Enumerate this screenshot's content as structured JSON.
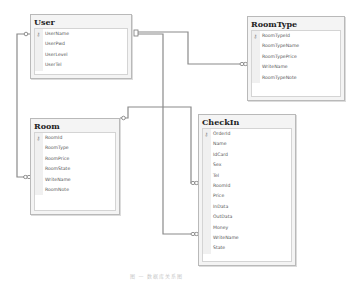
{
  "diagram": {
    "tables": [
      {
        "id": "user",
        "title": "User",
        "columns": [
          {
            "name": "UserName",
            "key": true
          },
          {
            "name": "UserPwd"
          },
          {
            "name": "UserLevel"
          },
          {
            "name": "UserTel"
          }
        ]
      },
      {
        "id": "roomtype",
        "title": "RoomType",
        "columns": [
          {
            "name": "RoomTypeId",
            "key": true
          },
          {
            "name": "RoomTypeName"
          },
          {
            "name": "RoomTypePrice"
          },
          {
            "name": "WriteName"
          },
          {
            "name": "RoomTypeNote"
          }
        ]
      },
      {
        "id": "room",
        "title": "Room",
        "columns": [
          {
            "name": "RoomId",
            "key": true
          },
          {
            "name": "RoomType"
          },
          {
            "name": "RoomPrice"
          },
          {
            "name": "RoomState"
          },
          {
            "name": "WriteName"
          },
          {
            "name": "RoomNote"
          }
        ]
      },
      {
        "id": "checkin",
        "title": "CheckIn",
        "columns": [
          {
            "name": "OrderId",
            "key": true
          },
          {
            "name": "Name"
          },
          {
            "name": "IdCard"
          },
          {
            "name": "Sex"
          },
          {
            "name": "Tel"
          },
          {
            "name": "RoomId"
          },
          {
            "name": "Price"
          },
          {
            "name": "InData"
          },
          {
            "name": "OutData"
          },
          {
            "name": "Money"
          },
          {
            "name": "WriteName"
          },
          {
            "name": "State"
          }
        ]
      }
    ],
    "relationships": [
      {
        "from": "User.UserName",
        "to": "Room.WriteName",
        "one": "key",
        "many": "infinity"
      },
      {
        "from": "User.UserName",
        "to": "RoomType.WriteName",
        "one": "key",
        "many": "infinity"
      },
      {
        "from": "User.UserName",
        "to": "CheckIn.WriteName",
        "one": "key",
        "many": "infinity"
      },
      {
        "from": "Room.RoomId",
        "to": "CheckIn.RoomId",
        "one": "key",
        "many": "infinity"
      }
    ],
    "key_symbol": "key-icon",
    "caption": "图 — 数据库关系图"
  }
}
